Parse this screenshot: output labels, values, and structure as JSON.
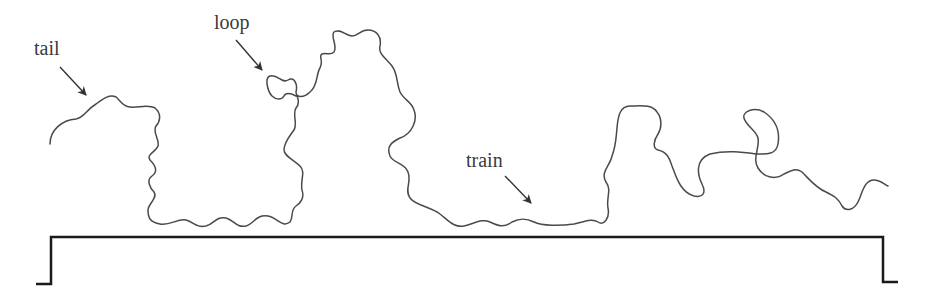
{
  "figure": {
    "colors": {
      "background": "#ffffff",
      "chain": "#4a4a4a",
      "surface": "#1a1a1a",
      "label": "#3a3a3a",
      "arrow": "#333333"
    }
  },
  "labels": {
    "tail": "tail",
    "loop": "loop",
    "train": "train"
  },
  "surface": {
    "path": "M 36 284 L 51 284 L 51 237 L 883 237 L 883 282 L 898 282"
  },
  "chain": {
    "path": "M 50 144 C 50 130, 62 120, 76 119 C 84 118, 86 110, 96 104 C 104 98, 110 94, 116 97 C 120 100, 122 106, 130 107 C 138 108, 148 104, 155 108 C 162 114, 160 122, 156 126 C 152 132, 160 140, 158 146 C 156 152, 146 154, 150 160 C 156 166, 158 172, 152 176 C 146 180, 150 188, 154 192 C 158 198, 148 204, 148 210 C 148 218, 150 222, 160 224 C 170 226, 178 218, 186 220 C 194 222, 196 228, 206 226 C 214 224, 216 216, 226 218 C 234 220, 236 228, 246 226 C 254 224, 256 214, 268 216 C 278 218, 282 228, 290 222 C 294 216, 290 210, 296 206 C 302 202, 304 196, 302 190 C 300 180, 306 172, 300 166 C 294 160, 284 156, 284 150 C 284 142, 290 136, 294 130 C 298 124, 292 114, 296 108 C 300 104, 298 96, 296 96 C 292 94, 286 92, 284 96 C 282 100, 276 100, 272 96 C 268 92, 264 78, 270 76 C 278 74, 282 84, 288 80 C 294 76, 298 84, 296 92 C 296 98, 304 98, 310 92 C 318 86, 316 74, 320 68 C 324 60, 318 56, 322 54 C 326 52, 330 56, 334 52 C 338 46, 330 36, 334 32 C 340 28, 346 36, 352 36 C 358 36, 360 30, 368 30 C 376 30, 382 36, 380 46 C 378 54, 386 58, 392 66 C 398 74, 396 82, 400 92 C 404 100, 412 102, 414 110 C 418 120, 412 134, 400 138 C 392 142, 386 146, 390 156 C 394 164, 404 162, 408 172 C 412 182, 404 190, 410 198 C 416 206, 430 206, 440 214 C 448 220, 454 228, 464 226 C 474 224, 482 218, 490 222 C 498 226, 504 228, 512 222 C 520 218, 526 218, 534 222 C 542 226, 560 226, 574 224 C 584 222, 592 218, 598 222 C 604 226, 610 218, 608 208 C 606 198, 612 190, 606 182 C 600 172, 610 166, 612 156 C 616 146, 616 138, 617 128 C 618 116, 620 106, 630 106 C 640 106, 652 104, 657 112 C 662 118, 662 128, 658 134 C 654 140, 652 148, 658 150 C 668 152, 670 160, 672 166 C 676 176, 680 192, 694 196 C 704 198, 706 192, 702 184 C 698 176, 694 160, 710 154 C 726 150, 742 152, 756 154 C 764 154, 776 156, 778 144 C 780 132, 776 120, 764 112 C 754 106, 742 112, 744 118 C 746 126, 756 130, 758 138 C 760 148, 752 158, 758 168 C 764 178, 776 180, 784 174 C 792 170, 796 168, 802 172 C 810 180, 816 188, 826 192 C 834 196, 838 198, 842 206 C 846 212, 854 210, 858 202 C 862 194, 864 180, 874 180 C 880 180, 884 184, 888 186",
    "segments": [
      "tail",
      "train",
      "loop",
      "train",
      "loop",
      "tail"
    ]
  },
  "arrows": {
    "tail": {
      "x1": 60,
      "y1": 67,
      "x2": 86,
      "y2": 95
    },
    "loop": {
      "x1": 236,
      "y1": 40,
      "x2": 262,
      "y2": 70
    },
    "train": {
      "x1": 505,
      "y1": 176,
      "x2": 531,
      "y2": 203
    }
  }
}
